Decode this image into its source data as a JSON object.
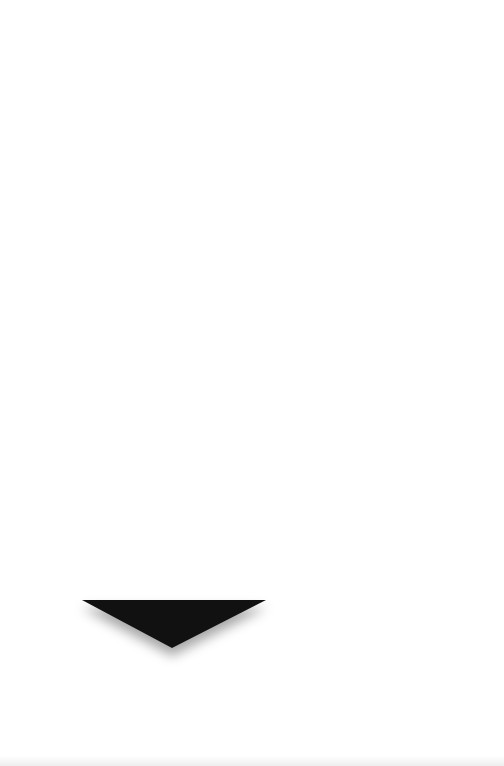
{
  "page": {
    "background": "#ffffff"
  },
  "arrow": {
    "icon": "triangle-down-icon",
    "direction": "down",
    "color": "#111111",
    "shadow": true
  }
}
